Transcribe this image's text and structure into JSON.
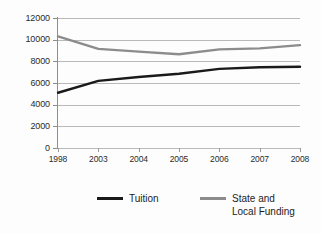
{
  "chart_data": {
    "type": "line",
    "title": "",
    "xlabel": "",
    "ylabel": "",
    "categories": [
      "1998",
      "2003",
      "2004",
      "2005",
      "2006",
      "2007",
      "2008"
    ],
    "ylim": [
      0,
      12000
    ],
    "yticks": [
      0,
      2000,
      4000,
      6000,
      8000,
      10000,
      12000
    ],
    "ytick_labels": [
      "0",
      "2000",
      "4000",
      "6000",
      "8000",
      "10000",
      "12000"
    ],
    "grid": true,
    "legend_position": "bottom",
    "series": [
      {
        "name": "Tuition",
        "color": "#1a1a1a",
        "values": [
          5100,
          6200,
          6550,
          6850,
          7300,
          7450,
          7500
        ]
      },
      {
        "name": "State and\nLocal Funding",
        "color": "#8c8c8c",
        "values": [
          10300,
          9150,
          8900,
          8650,
          9100,
          9200,
          9500
        ]
      }
    ]
  },
  "legend": {
    "items": [
      {
        "label": "Tuition",
        "color": "#1a1a1a"
      },
      {
        "label": "State and\nLocal Funding",
        "color": "#8c8c8c"
      }
    ]
  },
  "colors": {
    "tuition": "#1a1a1a",
    "funding": "#8c8c8c",
    "grid": "#b9b9b9",
    "axis": "#8d8d8d",
    "text": "#2b2b2b",
    "background": "#fdfdfd"
  }
}
